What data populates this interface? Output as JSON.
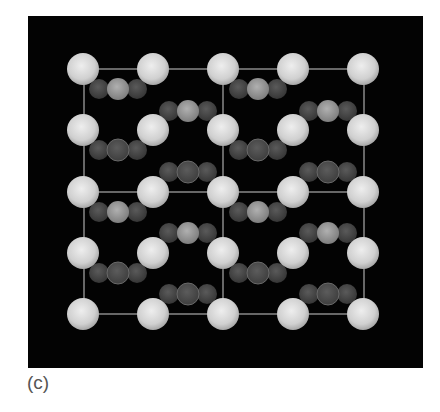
{
  "figure": {
    "label": "(c)",
    "panel": {
      "x": 28,
      "y": 16,
      "width": 395,
      "height": 352,
      "background": "#030303"
    },
    "colors": {
      "large_atom": "#d6d6d6",
      "small_outer_atom": "#4c4c4c",
      "small_center_light": "#9a9a9a",
      "small_center_dark": "#505050",
      "cell_line": "#8a8a8a"
    },
    "large_atom_radius": 16,
    "small_atom_radius": 10,
    "large_atoms": {
      "x": [
        83,
        153,
        223,
        293,
        363
      ],
      "y": [
        69,
        130,
        192,
        253,
        314
      ]
    },
    "cell_lines": {
      "horizontal_y": [
        69,
        192,
        314
      ],
      "vertical_x": [
        84,
        223,
        364
      ],
      "x_range": [
        84,
        364
      ],
      "y_range": [
        69,
        314
      ]
    },
    "trios": [
      {
        "cx": 118,
        "cy": 89,
        "center": "light"
      },
      {
        "cx": 258,
        "cy": 89,
        "center": "light"
      },
      {
        "cx": 188,
        "cy": 111,
        "center": "light"
      },
      {
        "cx": 328,
        "cy": 111,
        "center": "light"
      },
      {
        "cx": 118,
        "cy": 150,
        "center": "dark"
      },
      {
        "cx": 258,
        "cy": 150,
        "center": "dark"
      },
      {
        "cx": 188,
        "cy": 172,
        "center": "dark"
      },
      {
        "cx": 328,
        "cy": 172,
        "center": "dark"
      },
      {
        "cx": 118,
        "cy": 212,
        "center": "light"
      },
      {
        "cx": 258,
        "cy": 212,
        "center": "light"
      },
      {
        "cx": 188,
        "cy": 233,
        "center": "light"
      },
      {
        "cx": 328,
        "cy": 233,
        "center": "light"
      },
      {
        "cx": 118,
        "cy": 273,
        "center": "dark"
      },
      {
        "cx": 258,
        "cy": 273,
        "center": "dark"
      },
      {
        "cx": 188,
        "cy": 294,
        "center": "dark"
      },
      {
        "cx": 328,
        "cy": 294,
        "center": "dark"
      }
    ],
    "trio_spacing": 19
  }
}
